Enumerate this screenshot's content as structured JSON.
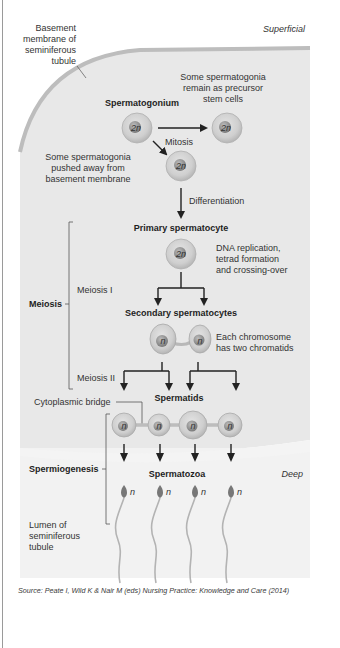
{
  "diagram": {
    "region_labels": {
      "superficial": "Superficial",
      "deep": "Deep",
      "basement_membrane": [
        "Basement",
        "membrane of",
        "seminiferous",
        "tubule"
      ],
      "lumen": [
        "Lumen of",
        "seminiferous",
        "tubule"
      ]
    },
    "stages": {
      "spermatogonium": "Spermatogonium",
      "primary": "Primary spermatocyte",
      "secondary": "Secondary spermatocytes",
      "spermatids": "Spermatids",
      "spermatozoa": "Spermatozoa"
    },
    "processes": {
      "mitosis": "Mitosis",
      "differentiation": "Differentiation",
      "meiosis": "Meiosis",
      "meiosis1": "Meiosis I",
      "meiosis2": "Meiosis II",
      "spermiogenesis": "Spermiogenesis",
      "cytoplasmic_bridge": "Cytoplasmic bridge"
    },
    "notes": {
      "stem": [
        "Some spermatogonia",
        "remain as precursor",
        "stem cells"
      ],
      "pushed": [
        "Some spermatogonia",
        "pushed away from",
        "basement membrane"
      ],
      "dna": [
        "DNA replication,",
        "tetrad formation",
        "and crossing-over"
      ],
      "chromatids": [
        "Each chromosome",
        "has two chromatids"
      ]
    },
    "ploidy": {
      "diploid": "2n",
      "haploid": "n"
    },
    "colors": {
      "tubule_fill": "#e6e6e6",
      "membrane": "#bdbdbd",
      "cell_outer": "#c8c8c8",
      "cell_nucleus": "#8e8e8e"
    }
  },
  "source": "Source: Peate I, Wild K & Nair M (eds) Nursing Practice: Knowledge and Care (2014)"
}
